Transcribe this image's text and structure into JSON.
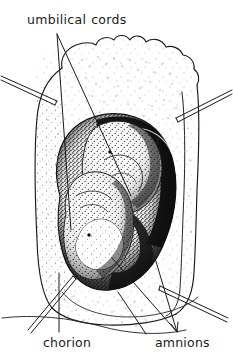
{
  "figure": {
    "kind": "anatomical-line-drawing",
    "width": 233,
    "height": 364,
    "background_color": "#ffffff",
    "ink_color": "#1a1a1a",
    "stipple_color": "#2b2b2b"
  },
  "labels": {
    "umbilical_cords": "umbilical  cords",
    "umbilical_cords_word_1": "umbilical",
    "umbilical_cords_word_2": "cords",
    "chorion": "chorion",
    "amnions": "amnions"
  },
  "leaders": {
    "umbilical_cords_note": "two crossing leader lines descend from the label into the sac interior",
    "chorion_note": "vertical leader rises from the chorion label to the chorion wall",
    "amnions_note": "two leader lines converge to an arrow point above the amnions label",
    "pointer_left_note": "double-ruled pointer entering from upper left margin",
    "pointer_right_note": "double-ruled pointer entering from upper right margin",
    "pointer_lower_left_note": "double-ruled pointer exiting to lower left margin",
    "pointer_lower_right_note": "double-ruled pointer exiting to lower right margin"
  }
}
